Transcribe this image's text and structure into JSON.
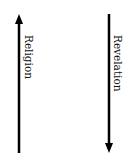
{
  "diagram": {
    "arrows": [
      {
        "id": "left",
        "label": "Religion",
        "direction": "up",
        "x": 19,
        "y_start": 153,
        "y_end": 15,
        "color": "#000000"
      },
      {
        "id": "right",
        "label": "Revelation",
        "direction": "down",
        "x": 109,
        "y_start": 14,
        "y_end": 152,
        "color": "#000000"
      }
    ],
    "labels": {
      "left": "Religion",
      "right": "Revelation"
    }
  }
}
